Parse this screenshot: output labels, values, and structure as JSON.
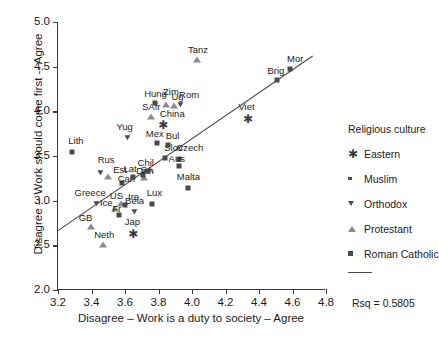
{
  "chart_data": {
    "type": "scatter",
    "title": "",
    "xlabel": "Disagree – Work is a duty to society – Agree",
    "ylabel": "Disagree -- Work should come first -- Agree",
    "xlim": [
      3.2,
      4.8
    ],
    "ylim": [
      2.0,
      5.0
    ],
    "xticks": [
      "3.2",
      "3.4",
      "3.6",
      "3.8",
      "4.0",
      "4.2",
      "4.4",
      "4.6",
      "4.8"
    ],
    "yticks": [
      "2.0",
      "2.5",
      "3.0",
      "3.5",
      "4.0",
      "4.5",
      "5.0"
    ],
    "grid": false,
    "legend_position": "right",
    "legend_title": "Religious culture",
    "legend_entries": [
      {
        "label": "Eastern",
        "marker": "star"
      },
      {
        "label": "Muslim",
        "marker": "small-square"
      },
      {
        "label": "Orthodox",
        "marker": "triangle-down"
      },
      {
        "label": "Protestant",
        "marker": "triangle-up"
      },
      {
        "label": "Roman Catholic",
        "marker": "square"
      }
    ],
    "fit_line": {
      "x": [
        3.2,
        4.72
      ],
      "y": [
        2.665,
        4.62
      ]
    },
    "annotation": "Rsq = 0.5805",
    "points": [
      {
        "label": "Lith",
        "x": 3.285,
        "y": 3.54,
        "marker": "square",
        "lx": -4,
        "ly": -16
      },
      {
        "label": "Rus",
        "x": 3.455,
        "y": 3.31,
        "marker": "triangle-down",
        "lx": -3,
        "ly": -18
      },
      {
        "label": "Est",
        "x": 3.5,
        "y": 3.27,
        "marker": "triangle-up",
        "lx": 5,
        "ly": -12
      },
      {
        "label": "Greece",
        "x": 3.43,
        "y": 2.965,
        "marker": "triangle-down",
        "lx": -22,
        "ly": -16
      },
      {
        "label": "GB",
        "x": 3.395,
        "y": 2.7,
        "marker": "triangle-up",
        "lx": -12,
        "ly": -14
      },
      {
        "label": "Neth",
        "x": 3.47,
        "y": 2.5,
        "marker": "triangle-up",
        "lx": -9,
        "ly": -15
      },
      {
        "label": "Ice",
        "x": 3.54,
        "y": 2.905,
        "marker": "triangle-up",
        "lx": -15,
        "ly": -11
      },
      {
        "label": "US",
        "x": 3.575,
        "y": 2.96,
        "marker": "triangle-up",
        "lx": -11,
        "ly": -13
      },
      {
        "label": "Ire",
        "x": 3.6,
        "y": 2.955,
        "marker": "square",
        "lx": 3,
        "ly": -13
      },
      {
        "label": "Fr",
        "x": 3.565,
        "y": 2.845,
        "marker": "square",
        "lx": -7,
        "ly": -11
      },
      {
        "label": "Bela",
        "x": 3.66,
        "y": 2.87,
        "marker": "triangle-down",
        "lx": -10,
        "ly": -16
      },
      {
        "label": "Jap",
        "x": 3.64,
        "y": 2.645,
        "marker": "star",
        "lx": -7,
        "ly": -15
      },
      {
        "label": "Can",
        "x": 3.58,
        "y": 3.195,
        "marker": "square",
        "lx": -4,
        "ly": -9
      },
      {
        "label": "Lat",
        "x": 3.645,
        "y": 3.26,
        "marker": "square",
        "lx": -9,
        "ly": -13
      },
      {
        "label": "Dan",
        "x": 3.715,
        "y": 3.255,
        "marker": "triangle-up",
        "lx": -8,
        "ly": -12
      },
      {
        "label": "SA",
        "x": 3.71,
        "y": 3.29,
        "marker": "square",
        "lx": -3,
        "ly": -10
      },
      {
        "label": "Chil",
        "x": 3.735,
        "y": 3.33,
        "marker": "square",
        "lx": -10,
        "ly": -13
      },
      {
        "label": "Yug",
        "x": 3.615,
        "y": 3.705,
        "marker": "triangle-down",
        "lx": -11,
        "ly": -16
      },
      {
        "label": "Lux",
        "x": 3.76,
        "y": 2.96,
        "marker": "square",
        "lx": -5,
        "ly": -16
      },
      {
        "label": "Slov",
        "x": 3.84,
        "y": 3.48,
        "marker": "square",
        "lx": -1,
        "ly": -15
      },
      {
        "label": "Czech",
        "x": 3.925,
        "y": 3.465,
        "marker": "square",
        "lx": -3,
        "ly": -16
      },
      {
        "label": "Aus",
        "x": 3.92,
        "y": 3.39,
        "marker": "square",
        "lx": -10,
        "ly": -12
      },
      {
        "label": "Malta",
        "x": 3.975,
        "y": 3.145,
        "marker": "square",
        "lx": -11,
        "ly": -16
      },
      {
        "label": "Mex",
        "x": 3.79,
        "y": 3.64,
        "marker": "square",
        "lx": -11,
        "ly": -14
      },
      {
        "label": "Bul",
        "x": 3.855,
        "y": 3.625,
        "marker": "square",
        "lx": -2,
        "ly": -14
      },
      {
        "label": "China",
        "x": 3.82,
        "y": 3.87,
        "marker": "star",
        "lx": -2,
        "ly": -14
      },
      {
        "label": "SAfr",
        "x": 3.755,
        "y": 3.94,
        "marker": "triangle-up",
        "lx": -9,
        "ly": -15
      },
      {
        "label": "Hung",
        "x": 3.78,
        "y": 4.095,
        "marker": "square",
        "lx": -11,
        "ly": -14
      },
      {
        "label": "Zim",
        "x": 3.845,
        "y": 4.075,
        "marker": "triangle-up",
        "lx": -3,
        "ly": -18
      },
      {
        "label": "Ug",
        "x": 3.895,
        "y": 4.065,
        "marker": "triangle-up",
        "lx": -3,
        "ly": -14
      },
      {
        "label": "Rom",
        "x": 3.935,
        "y": 4.075,
        "marker": "triangle-down",
        "lx": -2,
        "ly": -15
      },
      {
        "label": "Tanz",
        "x": 4.03,
        "y": 4.58,
        "marker": "triangle-up",
        "lx": -9,
        "ly": -15
      },
      {
        "label": "Viet",
        "x": 4.325,
        "y": 3.935,
        "marker": "star",
        "lx": -8,
        "ly": -15
      },
      {
        "label": "Brig",
        "x": 4.51,
        "y": 4.35,
        "marker": "square",
        "lx": -10,
        "ly": -14
      },
      {
        "label": "Mor",
        "x": 4.585,
        "y": 4.47,
        "marker": "square",
        "lx": -3,
        "ly": -15
      }
    ]
  }
}
